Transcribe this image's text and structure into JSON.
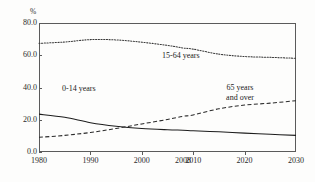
{
  "chart_data": {
    "type": "line",
    "title": "",
    "subtitle": "",
    "xlabel": "",
    "ylabel": "%",
    "y_unit_label": "%",
    "xlim": [
      1980,
      2030
    ],
    "ylim": [
      0.0,
      80.0
    ],
    "grid": false,
    "legend_position": "inline-annotations",
    "y_ticks": [
      "0.0",
      "20.0",
      "40.0",
      "60.0",
      "80.0"
    ],
    "y_tick_values": [
      0.0,
      20.0,
      40.0,
      60.0,
      80.0
    ],
    "x_ticks": [
      "1980",
      "1990",
      "2000",
      "2008",
      "2010",
      "2020",
      "2030"
    ],
    "x_tick_values": [
      1980,
      1990,
      2000,
      2008,
      2010,
      2020,
      2030
    ],
    "x": [
      1980,
      1985,
      1990,
      1995,
      2000,
      2005,
      2008,
      2010,
      2015,
      2020,
      2025,
      2030
    ],
    "series": [
      {
        "name": "15-64 years",
        "style": "dotted",
        "values": [
          67.4,
          68.2,
          69.7,
          69.5,
          68.1,
          66.1,
          64.5,
          63.8,
          60.7,
          59.2,
          58.7,
          58.1
        ]
      },
      {
        "name": "0-14 years",
        "style": "solid",
        "values": [
          23.5,
          21.5,
          18.2,
          16.0,
          14.6,
          13.8,
          13.5,
          13.2,
          12.5,
          11.7,
          11.0,
          10.3
        ]
      },
      {
        "name": "65 years and over",
        "style": "dashed",
        "values": [
          9.1,
          10.3,
          12.1,
          14.6,
          17.4,
          20.2,
          22.1,
          23.0,
          26.8,
          29.1,
          30.3,
          31.8
        ]
      }
    ],
    "annotations": [
      {
        "id": "label-15-64",
        "text": "15-64 years",
        "series": "15-64 years"
      },
      {
        "id": "label-0-14",
        "text": "0-14 years",
        "series": "0-14 years"
      },
      {
        "id": "label-65-line1",
        "text": "65 years",
        "series": "65 years and over"
      },
      {
        "id": "label-65-line2",
        "text": "and over",
        "series": "65 years and over"
      }
    ],
    "colors": {
      "axis": "#5b5b5b",
      "text": "#2a2a2a",
      "series_solid": "#1d1d1d",
      "series_dotted": "#3a3a3a",
      "series_dashed": "#2a2a2a",
      "background": "#fdfdfc"
    }
  }
}
